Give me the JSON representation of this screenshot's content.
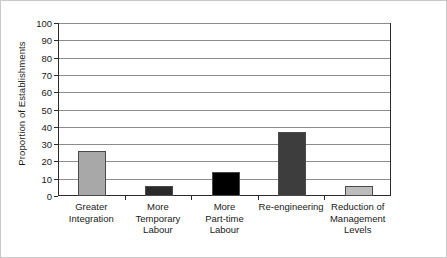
{
  "chart_data": {
    "type": "bar",
    "title": "",
    "xlabel": "",
    "ylabel": "Proportion of Establishments",
    "ylim": [
      0,
      100
    ],
    "yticks": [
      0,
      10,
      20,
      30,
      40,
      50,
      60,
      70,
      80,
      90,
      100
    ],
    "grid": true,
    "legend": false,
    "categories": [
      "Greater Integration",
      "More Temporary Labour",
      "More Part-time Labour",
      "Re-engineering",
      "Reduction of Management Levels"
    ],
    "category_label_lines": [
      [
        "Greater",
        "Integration"
      ],
      [
        "More",
        "Temporary",
        "Labour"
      ],
      [
        "More",
        "Part-time",
        "Labour"
      ],
      [
        "Re-engineering"
      ],
      [
        "Reduction of",
        "Management",
        "Levels"
      ]
    ],
    "values": [
      26,
      6,
      14,
      37,
      6
    ],
    "bar_colors": [
      "#a8a8a8",
      "#2a2a2a",
      "#000000",
      "#3d3d3d",
      "#bdbdbd"
    ],
    "bar_edge_color": "#4a4a4a"
  },
  "axes": {
    "y_tick_labels": [
      "100",
      "90",
      "80",
      "70",
      "60",
      "50",
      "40",
      "30",
      "20",
      "10",
      "0"
    ],
    "y_axis_title": "Proportion of Establishments"
  }
}
